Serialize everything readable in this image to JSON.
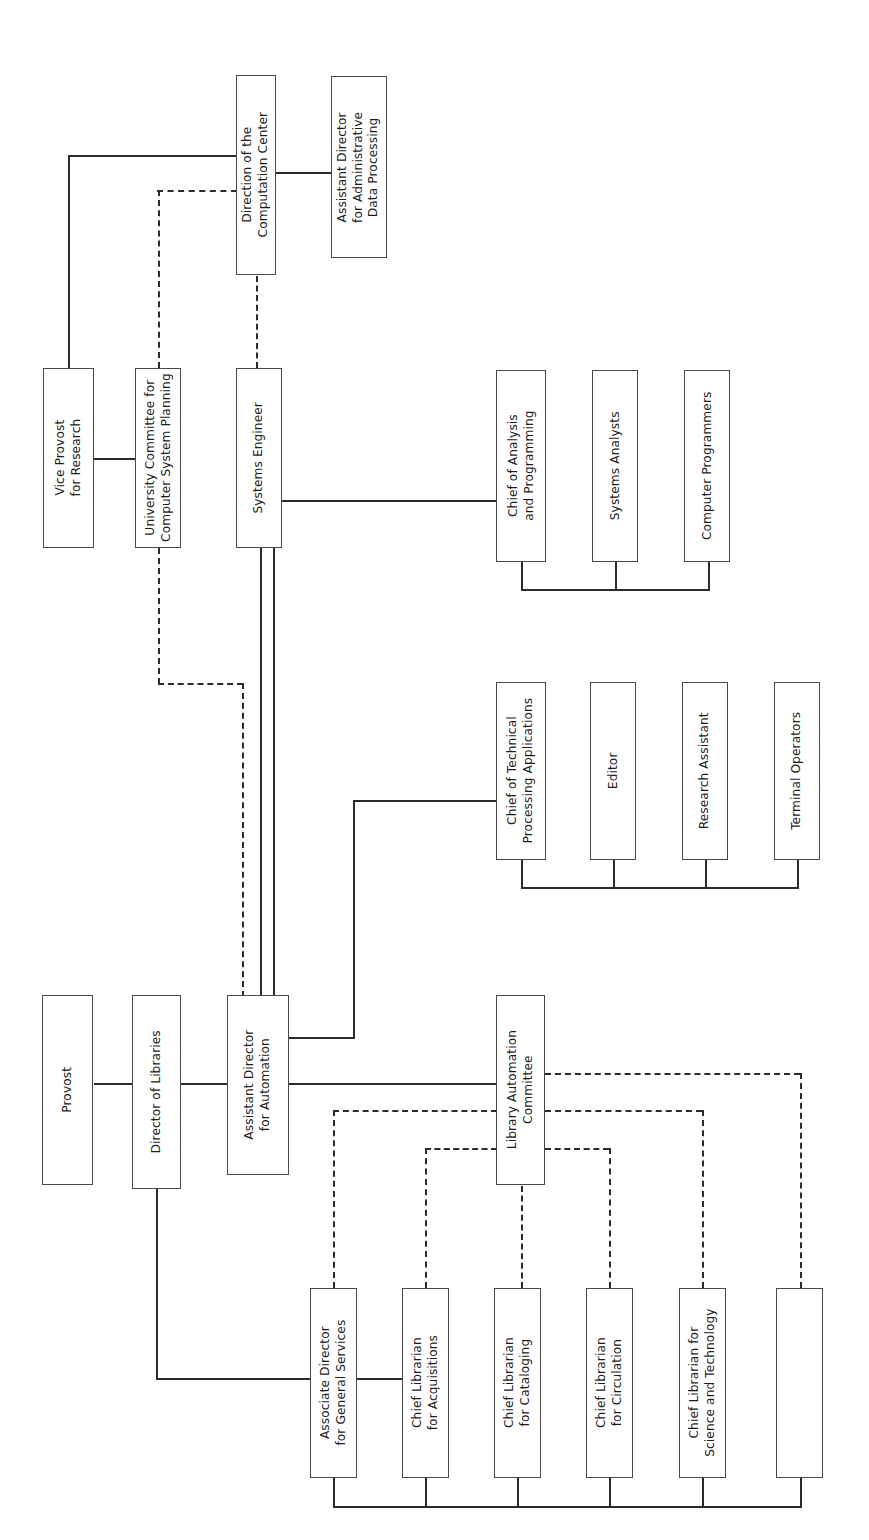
{
  "diagram": {
    "orientation": "rotated-90-ccw",
    "line_styles": {
      "solid": "direct reporting line",
      "dashed": "advisory / coordination line"
    },
    "colors": {
      "background": "#ffffff",
      "box_border": "#4a4a4a",
      "connector": "#2b2b2b",
      "text": "#1c1c1c"
    }
  },
  "nodes": {
    "direction_computation_center": {
      "label": "Direction of the\nComputation Center",
      "line1": "Direction of the",
      "line2": "Computation Center"
    },
    "assistant_director_adp": {
      "label": "Assistant Director\nfor Administrative\nData Processing",
      "line1": "Assistant Director",
      "line2": "for Administrative",
      "line3": "Data Processing"
    },
    "vice_provost_research": {
      "label": "Vice Provost\nfor Research",
      "line1": "Vice Provost",
      "line2": "for Research"
    },
    "university_committee": {
      "label": "University Committee for\nComputer System Planning",
      "line1": "University Committee for",
      "line2": "Computer System Planning"
    },
    "systems_engineer": {
      "label": "Systems Engineer",
      "line1": "Systems Engineer"
    },
    "chief_analysis_programming": {
      "label": "Chief of Analysis\nand Programming",
      "line1": "Chief of Analysis",
      "line2": "and Programming"
    },
    "systems_analysts": {
      "label": "Systems Analysts",
      "line1": "Systems Analysts"
    },
    "computer_programmers": {
      "label": "Computer Programmers",
      "line1": "Computer Programmers"
    },
    "chief_technical_processing": {
      "label": "Chief of Technical\nProcessing Applications",
      "line1": "Chief of Technical",
      "line2": "Processing Applications"
    },
    "editor": {
      "label": "Editor",
      "line1": "Editor"
    },
    "research_assistant": {
      "label": "Research Assistant",
      "line1": "Research Assistant"
    },
    "terminal_operators": {
      "label": "Terminal Operators",
      "line1": "Terminal Operators"
    },
    "provost": {
      "label": "Provost",
      "line1": "Provost"
    },
    "director_of_libraries": {
      "label": "Director of Libraries",
      "line1": "Director of Libraries"
    },
    "assistant_director_automation": {
      "label": "Assistant Director\nfor Automation",
      "line1": "Assistant Director",
      "line2": "for Automation"
    },
    "library_automation_committee": {
      "label": "Library Automation\nCommittee",
      "line1": "Library Automation",
      "line2": "Committee"
    },
    "associate_director_general_services": {
      "label": "Associate Director\nfor General Services",
      "line1": "Associate Director",
      "line2": "for General Services"
    },
    "chief_librarian_acquisitions": {
      "label": "Chief Librarian\nfor Acquisitions",
      "line1": "Chief Librarian",
      "line2": "for Acquisitions"
    },
    "chief_librarian_cataloging": {
      "label": "Chief Librarian\nfor Cataloging",
      "line1": "Chief Librarian",
      "line2": "for Cataloging"
    },
    "chief_librarian_circulation": {
      "label": "Chief Librarian\nfor Circulation",
      "line1": "Chief Librarian",
      "line2": "for Circulation"
    },
    "chief_librarian_science_tech": {
      "label": "Chief Librarian for\nScience and Technology",
      "line1": "Chief Librarian for",
      "line2": "Science and Technology"
    },
    "unlabeled_unit": {
      "label": "",
      "line1": ""
    }
  }
}
